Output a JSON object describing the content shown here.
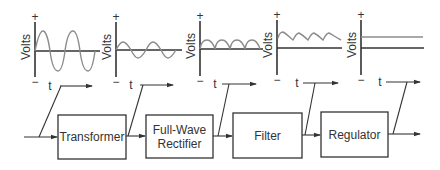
{
  "diagram": {
    "axis_labels": {
      "y": "Volts",
      "x": "t",
      "positive": "+",
      "negative": "−"
    },
    "blocks": [
      {
        "id": "transformer",
        "label": "Transformer"
      },
      {
        "id": "rectifier",
        "label_line1": "Full-Wave",
        "label_line2": "Rectifier"
      },
      {
        "id": "filter",
        "label": "Filter"
      },
      {
        "id": "regulator",
        "label": "Regulator"
      }
    ],
    "waveforms": [
      {
        "stage": "input",
        "shape": "AC sine, large amplitude"
      },
      {
        "stage": "after transformer",
        "shape": "AC sine, reduced amplitude"
      },
      {
        "stage": "after full-wave rectifier",
        "shape": "pulsating DC (rectified half-sine humps)"
      },
      {
        "stage": "after filter",
        "shape": "DC with ripple"
      },
      {
        "stage": "after regulator",
        "shape": "steady DC level"
      }
    ],
    "colors": {
      "line": "#333333",
      "waveform": "#8c8c8c",
      "background": "#ffffff"
    }
  }
}
